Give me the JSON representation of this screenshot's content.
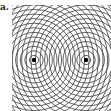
{
  "panel_label": "a.",
  "diagram": {
    "type": "two-source wave interference",
    "sources": [
      {
        "name": "source-1",
        "x": 34,
        "y": 60
      },
      {
        "name": "source-2",
        "x": 86,
        "y": 60
      }
    ],
    "ring_spacing": 4.6,
    "ring_count": 22,
    "clip": {
      "x": 12,
      "y": 5,
      "width": 99,
      "height": 106
    },
    "colors": {
      "rings": "#3a3a3a",
      "source": "#000000",
      "background": "#ffffff"
    }
  }
}
